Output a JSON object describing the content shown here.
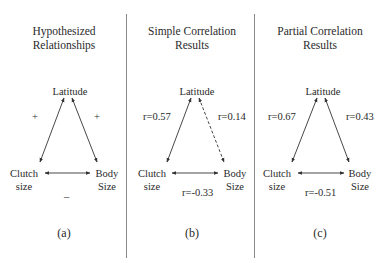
{
  "panels": [
    {
      "id": "a",
      "title_line1": "Hypothesized",
      "title_line2": "Relationships",
      "nodes": {
        "top": "Latitude",
        "left_line1": "Clutch",
        "left_line2": "size",
        "right_line1": "Body",
        "right_line2": "Size"
      },
      "edges": {
        "left": "+",
        "right": "+",
        "bottom": "–"
      },
      "edge_styles": {
        "left": "solid",
        "right": "solid",
        "bottom": "solid"
      },
      "caption": "(a)"
    },
    {
      "id": "b",
      "title_line1": "Simple Correlation",
      "title_line2": "Results",
      "nodes": {
        "top": "Latitude",
        "left_line1": "Clutch",
        "left_line2": "size",
        "right_line1": "Body",
        "right_line2": "Size"
      },
      "edges": {
        "left": "r=0.57",
        "right": "r=0.14",
        "bottom": "r=-0.33"
      },
      "edge_styles": {
        "left": "solid",
        "right": "dashed",
        "bottom": "solid"
      },
      "caption": "(b)"
    },
    {
      "id": "c",
      "title_line1": "Partial Correlation",
      "title_line2": "Results",
      "nodes": {
        "top": "Latitude",
        "left_line1": "Clutch",
        "left_line2": "size",
        "right_line1": "Body",
        "right_line2": "Size"
      },
      "edges": {
        "left": "r=0.67",
        "right": "r=0.43",
        "bottom": "r=-0.51"
      },
      "edge_styles": {
        "left": "solid",
        "right": "solid",
        "bottom": "solid"
      },
      "caption": "(c)"
    }
  ],
  "colors": {
    "text": "#2a2a2a",
    "arrow": "#333333",
    "separator": "#8a8a8a"
  }
}
